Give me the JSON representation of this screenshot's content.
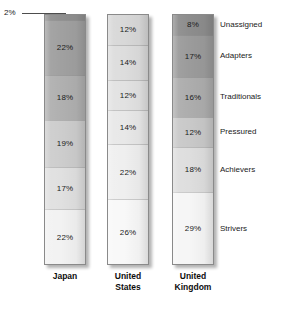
{
  "chart_data": {
    "type": "bar",
    "subtype": "stacked-100-percent",
    "title": "",
    "xlabel": "",
    "ylabel": "",
    "ylim": [
      0,
      100
    ],
    "grid": false,
    "legend_position": "right",
    "categories": [
      "Japan",
      "United States",
      "United Kingdom"
    ],
    "segment_order_top_to_bottom": [
      "Unassigned",
      "Adapters",
      "Traditionals",
      "Pressured",
      "Achievers",
      "Strivers"
    ],
    "series": [
      {
        "name": "Unassigned",
        "values": [
          2,
          12,
          8
        ]
      },
      {
        "name": "Adapters",
        "values": [
          22,
          14,
          17
        ]
      },
      {
        "name": "Traditionals",
        "values": [
          18,
          12,
          16
        ]
      },
      {
        "name": "Pressured",
        "values": [
          19,
          14,
          12
        ]
      },
      {
        "name": "Achievers",
        "values": [
          17,
          22,
          18
        ]
      },
      {
        "name": "Strivers",
        "values": [
          22,
          26,
          29
        ]
      }
    ],
    "annotations": [
      {
        "text": "2%",
        "points_to": "Japan / Unassigned",
        "leader_line": true
      }
    ],
    "colors": {
      "Unassigned": "#8f8f8f",
      "Adapters": "#a3a3a3",
      "Traditionals": "#b5b5b5",
      "Pressured": "#cfcfcf",
      "Achievers": "#e2e2e2",
      "Strivers": "#f4f4f4",
      "outline": "#8a8a8a",
      "text": "#1a1a1a"
    }
  },
  "callout": {
    "label": "2%"
  },
  "bars": [
    {
      "name": "Japan",
      "axis_label": "Japan",
      "axis_label_lines": [
        "Japan",
        ""
      ],
      "segments": [
        {
          "series": "Unassigned",
          "value": 2,
          "label": "2%",
          "label_visible": false,
          "color": "#8f8f8f"
        },
        {
          "series": "Adapters",
          "value": 22,
          "label": "22%",
          "label_visible": true,
          "color": "#a0a0a0"
        },
        {
          "series": "Traditionals",
          "value": 18,
          "label": "18%",
          "label_visible": true,
          "color": "#b0b0b0"
        },
        {
          "series": "Pressured",
          "value": 19,
          "label": "19%",
          "label_visible": true,
          "color": "#cdcdcd"
        },
        {
          "series": "Achievers",
          "value": 17,
          "label": "17%",
          "label_visible": true,
          "color": "#e0e0e0"
        },
        {
          "series": "Strivers",
          "value": 22,
          "label": "22%",
          "label_visible": true,
          "color": "#f2f2f2"
        }
      ]
    },
    {
      "name": "United States",
      "axis_label": "United States",
      "axis_label_lines": [
        "United",
        "States"
      ],
      "segments": [
        {
          "series": "Unassigned",
          "value": 12,
          "label": "12%",
          "label_visible": true,
          "color": "#d8d8d8"
        },
        {
          "series": "Adapters",
          "value": 14,
          "label": "14%",
          "label_visible": true,
          "color": "#dddddd"
        },
        {
          "series": "Traditionals",
          "value": 12,
          "label": "12%",
          "label_visible": true,
          "color": "#e2e2e2"
        },
        {
          "series": "Pressured",
          "value": 14,
          "label": "14%",
          "label_visible": true,
          "color": "#e8e8e8"
        },
        {
          "series": "Achievers",
          "value": 22,
          "label": "22%",
          "label_visible": true,
          "color": "#efefef"
        },
        {
          "series": "Strivers",
          "value": 26,
          "label": "26%",
          "label_visible": true,
          "color": "#f8f8f8"
        }
      ]
    },
    {
      "name": "United Kingdom",
      "axis_label": "United Kingdom",
      "axis_label_lines": [
        "United",
        "Kingdom"
      ],
      "segments": [
        {
          "series": "Unassigned",
          "value": 8,
          "label": "8%",
          "label_visible": true,
          "color": "#8d8d8d"
        },
        {
          "series": "Adapters",
          "value": 17,
          "label": "17%",
          "label_visible": true,
          "color": "#9b9b9b"
        },
        {
          "series": "Traditionals",
          "value": 16,
          "label": "16%",
          "label_visible": true,
          "color": "#adadad"
        },
        {
          "series": "Pressured",
          "value": 12,
          "label": "12%",
          "label_visible": true,
          "color": "#c9c9c9"
        },
        {
          "series": "Achievers",
          "value": 18,
          "label": "18%",
          "label_visible": true,
          "color": "#dedede"
        },
        {
          "series": "Strivers",
          "value": 29,
          "label": "29%",
          "label_visible": true,
          "color": "#f6f6f6"
        }
      ]
    }
  ],
  "legend": {
    "items": [
      {
        "label": "Unassigned"
      },
      {
        "label": "Adapters"
      },
      {
        "label": "Traditionals"
      },
      {
        "label": "Pressured"
      },
      {
        "label": "Achievers"
      },
      {
        "label": "Strivers"
      }
    ]
  }
}
